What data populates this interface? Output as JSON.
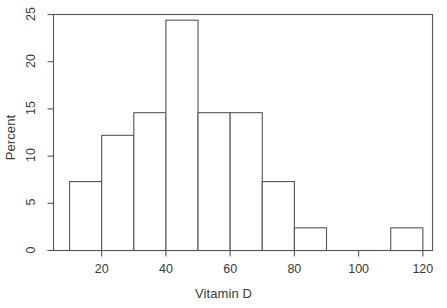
{
  "chart_data": {
    "type": "bar",
    "subtype": "histogram",
    "title": "",
    "xlabel": "Vitamin D",
    "ylabel": "Percent",
    "xlim": [
      5,
      123
    ],
    "ylim": [
      0,
      25
    ],
    "grid": false,
    "legend": null,
    "bin_width": 10,
    "bin_edges": [
      10,
      20,
      30,
      40,
      50,
      60,
      70,
      80,
      90,
      100,
      110,
      120
    ],
    "categories": [
      "10-20",
      "20-30",
      "30-40",
      "40-50",
      "50-60",
      "60-70",
      "70-80",
      "80-90",
      "90-100",
      "100-110",
      "110-120"
    ],
    "values": [
      7.3,
      12.2,
      14.6,
      24.4,
      14.6,
      14.6,
      7.3,
      2.4,
      0,
      0,
      2.4
    ],
    "xticks": [
      20,
      40,
      60,
      80,
      100,
      120
    ],
    "xtick_labels": [
      "20",
      "40",
      "60",
      "80",
      "100",
      "120"
    ],
    "yticks": [
      0,
      5,
      10,
      15,
      20,
      25
    ],
    "ytick_labels": [
      "0",
      "5",
      "10",
      "15",
      "20",
      "25"
    ],
    "bar_fill_color": "#ffffff",
    "bar_edge_color": "#555555",
    "axis_color": "#555555",
    "background_color": "#ffffff"
  }
}
